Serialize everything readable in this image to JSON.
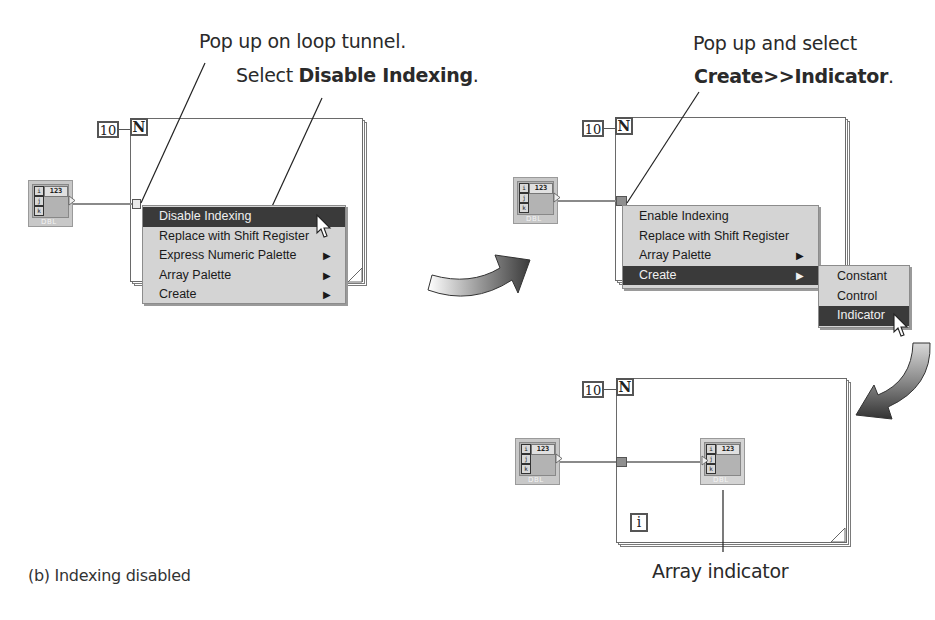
{
  "panel1": {
    "callout_line1": "Pop up on loop tunnel.",
    "callout_line2_prefix": "Select ",
    "callout_line2_bold": "Disable Indexing",
    "callout_line2_suffix": ".",
    "count_value": "10",
    "count_terminal": "N",
    "control": {
      "index_labels": [
        "i",
        "j",
        "k"
      ],
      "value": "123",
      "type": "DBL"
    },
    "menu": {
      "items": [
        {
          "label": "Disable Indexing",
          "submenu": false,
          "selected": true
        },
        {
          "label": "Replace with Shift Register",
          "submenu": false,
          "selected": false
        },
        {
          "label": "Express Numeric Palette",
          "submenu": true,
          "selected": false
        },
        {
          "label": "Array Palette",
          "submenu": true,
          "selected": false
        },
        {
          "label": "Create",
          "submenu": true,
          "selected": false
        }
      ]
    }
  },
  "panel2": {
    "callout_line1": "Pop up and select",
    "callout_line2_bold": "Create>>Indicator",
    "callout_line2_suffix": ".",
    "count_value": "10",
    "count_terminal": "N",
    "control": {
      "index_labels": [
        "i",
        "j",
        "k"
      ],
      "value": "123",
      "type": "DBL"
    },
    "menu": {
      "items": [
        {
          "label": "Enable Indexing",
          "submenu": false,
          "selected": false
        },
        {
          "label": "Replace with Shift Register",
          "submenu": false,
          "selected": false
        },
        {
          "label": "Array Palette",
          "submenu": true,
          "selected": false
        },
        {
          "label": "Create",
          "submenu": true,
          "selected": true
        }
      ]
    },
    "submenu": {
      "items": [
        {
          "label": "Constant",
          "selected": false
        },
        {
          "label": "Control",
          "selected": false
        },
        {
          "label": "Indicator",
          "selected": true
        }
      ]
    }
  },
  "panel3": {
    "count_value": "10",
    "count_terminal": "N",
    "iteration_terminal": "i",
    "control": {
      "index_labels": [
        "i",
        "j",
        "k"
      ],
      "value": "123",
      "type": "DBL"
    },
    "indicator": {
      "index_labels": [
        "i",
        "j",
        "k"
      ],
      "value": "123",
      "type": "DBL"
    },
    "indicator_label": "Array indicator"
  },
  "caption": "(b)  Indexing disabled",
  "colors": {
    "menu_bg": "#d4d4d4",
    "menu_selected": "#3a3a3a",
    "loop_border": "#6a6a6a",
    "control_bg": "#c8c8c8"
  }
}
